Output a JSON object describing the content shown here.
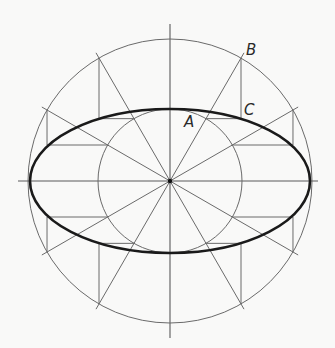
{
  "diagram": {
    "background": "#f9f9f8",
    "center": {
      "x": 170,
      "y": 181
    },
    "outer_circle_radius": 142,
    "inner_circle_radius": 72,
    "ellipse": {
      "semi_major": 140,
      "semi_minor": 72,
      "color": "#1a1a1a"
    },
    "radial_line_count": 12,
    "radial_angle_step_deg": 30,
    "radial_overshoot": 6,
    "axis_extent": {
      "horizontal": [
        18,
        318
      ],
      "vertical": [
        24,
        338
      ]
    },
    "labels": [
      {
        "id": "A",
        "text": "A",
        "x": 184,
        "y": 127
      },
      {
        "id": "B",
        "text": "B",
        "x": 246,
        "y": 55
      },
      {
        "id": "C",
        "text": "C",
        "x": 244,
        "y": 115
      }
    ]
  }
}
